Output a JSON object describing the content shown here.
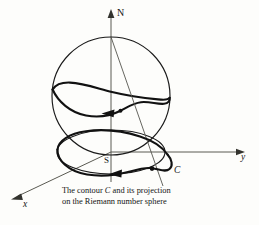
{
  "figure": {
    "background_color": "#fdfdfb",
    "ink_color": "#111111",
    "axis_color": "#5a5a52"
  },
  "labels": {
    "north_pole": "N",
    "south_pole": "S",
    "contour": "C",
    "x_axis": "x",
    "y_axis": "y"
  },
  "caption": {
    "line1_before": "The contour ",
    "line1_italic": "C",
    "line1_after": " and its projection",
    "line2": "on the Riemann number sphere",
    "full_text": "The contour C and its projection on the Riemann number sphere"
  },
  "geometry": {
    "sphere_center": {
      "x": 111,
      "y": 96
    },
    "sphere_radius": 59,
    "north_pole_point": {
      "x": 111,
      "y": 37
    },
    "south_pole_point": {
      "x": 111,
      "y": 155
    },
    "plane_ellipse": {
      "cx": 111,
      "cy": 152,
      "rx": 54,
      "ry": 22
    },
    "vertical_axis": {
      "x": 111,
      "y_top": 11,
      "y_bottom": 182
    },
    "y_axis_end": {
      "x": 245,
      "y": 152
    },
    "x_axis_end": {
      "x": 12,
      "y": 199
    },
    "projection_point_on_plane": {
      "x": 152,
      "y": 169
    },
    "contour_arrow_on_sphere": {
      "x": 110,
      "y": 112,
      "direction": "left"
    },
    "contour_arrow_on_plane": {
      "x": 118,
      "y": 170,
      "direction": "left"
    }
  }
}
